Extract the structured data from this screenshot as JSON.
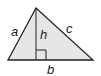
{
  "diagram": {
    "type": "triangle",
    "fill_color": "#e6e6e6",
    "stroke_color": "#222222",
    "vertices": {
      "apex": [
        36,
        8
      ],
      "base_left": [
        8,
        60
      ],
      "base_right": [
        93,
        60
      ]
    },
    "height_foot": [
      36,
      60
    ],
    "labels": {
      "a": "a",
      "b": "b",
      "c": "c",
      "h": "h"
    }
  }
}
